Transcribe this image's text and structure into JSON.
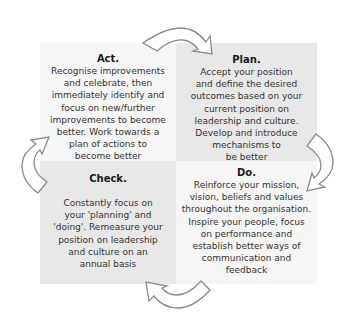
{
  "diagram": {
    "type": "cycle",
    "quadrants": {
      "act": {
        "title": "Act.",
        "lines": [
          "Recognise improvements",
          "and celebrate, then",
          "immediately identify and",
          "focus on new/further",
          "improvements to become",
          "better. Work towards a",
          "plan of actions to",
          "become better"
        ]
      },
      "plan": {
        "title": "Plan.",
        "lines": [
          "Accept your position",
          "and define the desired",
          "outcomes based on your",
          "current position on",
          "leadership and culture.",
          "Develop and introduce",
          "mechanisms to",
          "be better"
        ]
      },
      "check": {
        "title": "Check.",
        "lines": [
          "Constantly focus on",
          "your 'planning' and",
          "'doing'. Remeasure your",
          "position on leadership",
          "and culture on an",
          "annual basis"
        ]
      },
      "do": {
        "title": "Do.",
        "lines": [
          "Reinforce your mission,",
          "vision, beliefs and values",
          "throughout the organisation.",
          "Inspire your people, focus",
          "on performance and",
          "establish better ways of",
          "communication and",
          "feedback"
        ]
      }
    },
    "arrows": [
      {
        "from": "act",
        "to": "plan",
        "icon": "curved-arrow-right-icon"
      },
      {
        "from": "plan",
        "to": "do",
        "icon": "curved-arrow-down-icon"
      },
      {
        "from": "do",
        "to": "check",
        "icon": "curved-arrow-left-icon"
      },
      {
        "from": "check",
        "to": "act",
        "icon": "curved-arrow-up-icon"
      }
    ],
    "colors": {
      "light_box": "#f6f6f6",
      "dark_box": "#e8e8e8",
      "arrow_stroke": "#8a8a8a",
      "arrow_fill": "#ffffff"
    }
  }
}
